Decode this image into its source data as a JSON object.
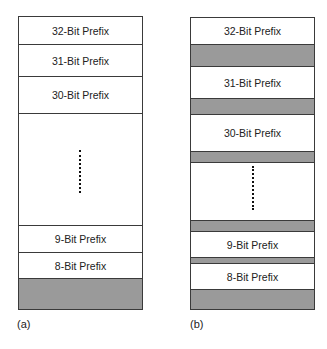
{
  "figure": {
    "panel_a": {
      "caption": "(a)",
      "rows": [
        {
          "label": "32-Bit Prefix",
          "type": "prefix"
        },
        {
          "label": "31-Bit Prefix",
          "type": "prefix"
        },
        {
          "label": "30-Bit Prefix",
          "type": "prefix"
        },
        {
          "label": "",
          "type": "ellipsis"
        },
        {
          "label": "9-Bit Prefix",
          "type": "prefix"
        },
        {
          "label": "8-Bit Prefix",
          "type": "prefix"
        },
        {
          "label": "",
          "type": "gray"
        }
      ]
    },
    "panel_b": {
      "caption": "(b)",
      "rows": [
        {
          "label": "32-Bit Prefix",
          "type": "prefix"
        },
        {
          "label": "",
          "type": "gray"
        },
        {
          "label": "31-Bit Prefix",
          "type": "prefix"
        },
        {
          "label": "",
          "type": "gray"
        },
        {
          "label": "30-Bit Prefix",
          "type": "prefix"
        },
        {
          "label": "",
          "type": "gray"
        },
        {
          "label": "",
          "type": "ellipsis"
        },
        {
          "label": "",
          "type": "gray"
        },
        {
          "label": "9-Bit Prefix",
          "type": "prefix"
        },
        {
          "label": "",
          "type": "gray"
        },
        {
          "label": "8-Bit Prefix",
          "type": "prefix"
        },
        {
          "label": "",
          "type": "gray"
        }
      ]
    },
    "colors": {
      "border": "#3a3a3a",
      "gray_fill": "#9a9a9a"
    }
  }
}
